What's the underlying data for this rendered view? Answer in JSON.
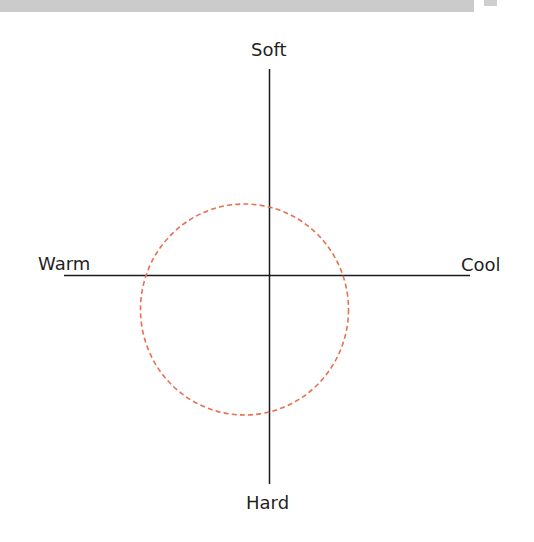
{
  "diagram": {
    "type": "quadrant-axes",
    "axes": {
      "top": "Soft",
      "bottom": "Hard",
      "left": "Warm",
      "right": "Cool"
    },
    "highlight": {
      "shape": "circle",
      "style": "dashed",
      "color": "#e8704f"
    },
    "colors": {
      "axis": "#1a1a1a",
      "label": "#1f1f1f",
      "header_band": "#cbcbcb"
    }
  }
}
